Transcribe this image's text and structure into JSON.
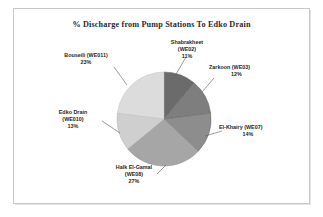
{
  "chart_data": {
    "type": "pie",
    "title": "% Discharge from Pump Stations To Edko Drain",
    "xlabel": "",
    "ylabel": "",
    "legend_position": "none",
    "labels_outside": true,
    "categories": [
      "Shabrakheet (WE02)",
      "Zarkoon (WE03)",
      "El-Khairy (WE07)",
      "Halk El-Gamal (WE08)",
      "Edko Drain (WE010)",
      "Bouseili (WE011)"
    ],
    "values": [
      11,
      12,
      14,
      27,
      13,
      23
    ],
    "value_unit": "%",
    "start_angle_deg": 0,
    "direction": "clockwise",
    "slices": [
      {
        "name": "Shabrakheet (WE02)",
        "station_name": "Shabrakheet",
        "station_code": "(WE02)",
        "value": 11,
        "percent_label": "11%",
        "color": "#6b6b6b",
        "start_deg": 0,
        "end_deg": 39.6
      },
      {
        "name": "Zarkoon (WE03)",
        "station_name": "Zarkoon",
        "station_code": "(WE03)",
        "value": 12,
        "percent_label": "12%",
        "color": "#7e7e7e",
        "start_deg": 39.6,
        "end_deg": 82.8
      },
      {
        "name": "El-Khairy (WE07)",
        "station_name": "El-Khairy",
        "station_code": "(WE07)",
        "value": 14,
        "percent_label": "14%",
        "color": "#8d8d8d",
        "start_deg": 82.8,
        "end_deg": 133.2
      },
      {
        "name": "Halk El-Gamal (WE08)",
        "station_name": "Halk El-Gamal",
        "station_code": "(WE08)",
        "value": 27,
        "percent_label": "27%",
        "color": "#a6a6a6",
        "start_deg": 133.2,
        "end_deg": 230.4
      },
      {
        "name": "Edko Drain (WE010)",
        "station_name": "Edko Drain",
        "station_code": "(WE010)",
        "value": 13,
        "percent_label": "13%",
        "color": "#cfcfcf",
        "start_deg": 230.4,
        "end_deg": 277.2
      },
      {
        "name": "Bouseili (WE011)",
        "station_name": "Bouseili",
        "station_code": "(WE011)",
        "value": 23,
        "percent_label": "23%",
        "color": "#dcdcdc",
        "start_deg": 277.2,
        "end_deg": 360
      }
    ]
  },
  "chart": {
    "title": "% Discharge from Pump Stations To Edko Drain",
    "labels": {
      "shabrakheet": {
        "line1": "Shabrakheet",
        "line2": "(WE02)",
        "line3": "11%"
      },
      "zarkoon": {
        "line1": "Zarkoon (WE03)",
        "line2": "12%"
      },
      "elkhairy": {
        "line1": "El-Khairy (WE07)",
        "line2": "14%"
      },
      "halk": {
        "line1": "Halk El-Gamal",
        "line2": "(WE08)",
        "line3": "27%"
      },
      "edko": {
        "line1": "Edko Drain",
        "line2": "(WE010)",
        "line3": "13%"
      },
      "bouseili": {
        "line1": "Bouseili (WE011)",
        "line2": "23%"
      }
    }
  },
  "colors": {
    "background": "#ffffff",
    "frame_border": "#c9c9c9",
    "title_text": "#2b2b2b",
    "label_text": "#1f1f1f",
    "leader_line": "#5a5a5a",
    "slice_edge": "#6f6f6f"
  }
}
